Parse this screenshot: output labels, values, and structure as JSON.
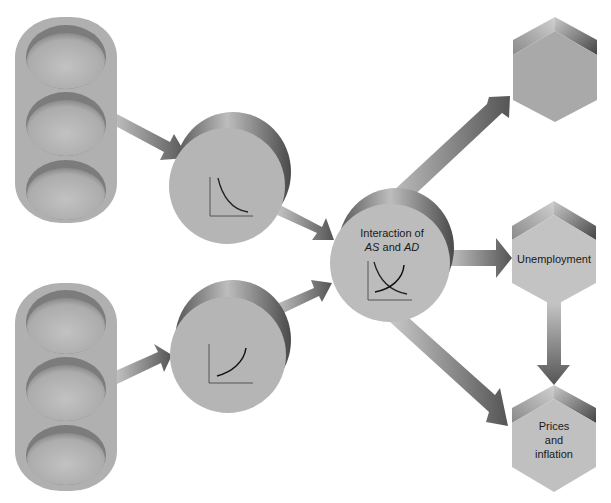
{
  "diagram": {
    "type": "flow-diagram",
    "nodes": [
      {
        "id": "input-group-top",
        "shape": "pill-with-3-ellipses",
        "label": ""
      },
      {
        "id": "input-group-bottom",
        "shape": "pill-with-3-ellipses",
        "label": ""
      },
      {
        "id": "ad-node",
        "shape": "cylinder",
        "label": "",
        "icon": "downward-sloping-curve-icon"
      },
      {
        "id": "as-node",
        "shape": "cylinder",
        "label": "",
        "icon": "upward-sloping-curve-icon"
      },
      {
        "id": "interaction-node",
        "shape": "cylinder",
        "label_line1": "Interaction of",
        "label_as": "AS",
        "label_and": " and ",
        "label_ad": "AD",
        "icon": "crossing-curves-icon"
      },
      {
        "id": "output-top",
        "shape": "hexagon",
        "label": ""
      },
      {
        "id": "output-unemployment",
        "shape": "hexagon",
        "label": "Unemployment"
      },
      {
        "id": "output-prices",
        "shape": "hexagon",
        "label_line1": "Prices",
        "label_line2": "and",
        "label_line3": "inflation"
      }
    ],
    "edges": [
      {
        "from": "input-group-top",
        "to": "ad-node"
      },
      {
        "from": "input-group-bottom",
        "to": "as-node"
      },
      {
        "from": "ad-node",
        "to": "interaction-node"
      },
      {
        "from": "as-node",
        "to": "interaction-node"
      },
      {
        "from": "interaction-node",
        "to": "output-top"
      },
      {
        "from": "interaction-node",
        "to": "output-unemployment"
      },
      {
        "from": "interaction-node",
        "to": "output-prices"
      },
      {
        "from": "output-unemployment",
        "to": "output-prices"
      }
    ],
    "colors": {
      "shape_fill": "#b3b3b3",
      "shape_dark": "#6e6e6e",
      "arrow_light": "#c4c4c4",
      "arrow_dark": "#5c5c5c",
      "background": "#ffffff",
      "text": "#1a1a1a"
    }
  }
}
